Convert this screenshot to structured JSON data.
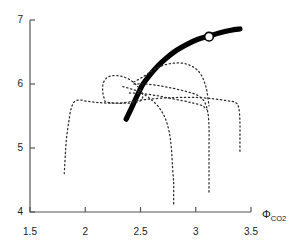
{
  "chart_data": {
    "type": "line",
    "title": "",
    "xlabel": "Φ_CO2",
    "xlabel_base": "Φ",
    "xlabel_sub": "CO",
    "xlabel_sub2": "2",
    "ylabel": "",
    "xlim": [
      1.5,
      3.5
    ],
    "ylim": [
      4,
      7
    ],
    "grid": false,
    "legend": null,
    "xticks": [
      1.5,
      2,
      2.5,
      3,
      3.5
    ],
    "xtick_labels": [
      "1.5",
      "2",
      "2.5",
      "3",
      "3.5"
    ],
    "yticks": [
      4,
      5,
      6,
      7
    ],
    "ytick_labels": [
      "4",
      "5",
      "6",
      "7"
    ],
    "series": [
      {
        "name": "main-bold-curve",
        "style": "solid-thick",
        "color": "#000000",
        "points": [
          [
            2.37,
            5.45
          ],
          [
            2.42,
            5.63
          ],
          [
            2.47,
            5.82
          ],
          [
            2.52,
            5.99
          ],
          [
            2.58,
            6.13
          ],
          [
            2.65,
            6.27
          ],
          [
            2.73,
            6.4
          ],
          [
            2.82,
            6.52
          ],
          [
            2.92,
            6.62
          ],
          [
            3.02,
            6.7
          ],
          [
            3.12,
            6.75
          ],
          [
            3.22,
            6.8
          ],
          [
            3.32,
            6.84
          ],
          [
            3.4,
            6.86
          ]
        ]
      },
      {
        "name": "dotted-curve-left",
        "style": "dotted",
        "color": "#2b2b2b",
        "points": [
          [
            1.81,
            4.6
          ],
          [
            1.82,
            4.9
          ],
          [
            1.83,
            5.15
          ],
          [
            1.85,
            5.4
          ],
          [
            1.87,
            5.6
          ],
          [
            1.9,
            5.72
          ],
          [
            1.95,
            5.75
          ],
          [
            2.02,
            5.73
          ],
          [
            2.12,
            5.71
          ],
          [
            2.24,
            5.7
          ],
          [
            2.36,
            5.71
          ],
          [
            2.46,
            5.74
          ],
          [
            2.56,
            5.76
          ],
          [
            2.7,
            5.78
          ],
          [
            2.85,
            5.79
          ],
          [
            3.0,
            5.79
          ],
          [
            3.15,
            5.77
          ],
          [
            3.28,
            5.74
          ],
          [
            3.36,
            5.71
          ],
          [
            3.39,
            5.62
          ],
          [
            3.4,
            5.4
          ],
          [
            3.4,
            5.15
          ],
          [
            3.4,
            4.93
          ]
        ]
      },
      {
        "name": "dotted-curve-loop",
        "style": "dotted",
        "color": "#2b2b2b",
        "points": [
          [
            2.18,
            5.72
          ],
          [
            2.16,
            5.86
          ],
          [
            2.16,
            5.99
          ],
          [
            2.19,
            6.09
          ],
          [
            2.25,
            6.13
          ],
          [
            2.33,
            6.12
          ],
          [
            2.41,
            6.06
          ],
          [
            2.47,
            5.97
          ],
          [
            2.51,
            5.88
          ],
          [
            2.52,
            5.8
          ],
          [
            2.5,
            5.74
          ],
          [
            2.44,
            5.71
          ],
          [
            2.36,
            5.7
          ],
          [
            2.28,
            5.7
          ],
          [
            2.22,
            5.71
          ],
          [
            2.18,
            5.72
          ]
        ]
      },
      {
        "name": "dotted-curve-mid-descend",
        "style": "dotted",
        "color": "#2b2b2b",
        "points": [
          [
            2.34,
            5.96
          ],
          [
            2.42,
            5.92
          ],
          [
            2.5,
            5.87
          ],
          [
            2.58,
            5.78
          ],
          [
            2.66,
            5.65
          ],
          [
            2.72,
            5.48
          ],
          [
            2.76,
            5.25
          ],
          [
            2.78,
            4.98
          ],
          [
            2.79,
            4.7
          ],
          [
            2.8,
            4.45
          ],
          [
            2.8,
            4.24
          ],
          [
            2.8,
            4.1
          ]
        ]
      },
      {
        "name": "dotted-curve-right-arc",
        "style": "dotted",
        "color": "#2b2b2b",
        "points": [
          [
            2.44,
            6.0
          ],
          [
            2.55,
            6.0
          ],
          [
            2.68,
            5.97
          ],
          [
            2.8,
            5.93
          ],
          [
            2.92,
            5.88
          ],
          [
            3.02,
            5.82
          ],
          [
            3.08,
            5.72
          ],
          [
            3.11,
            5.55
          ],
          [
            3.12,
            5.32
          ],
          [
            3.12,
            5.08
          ],
          [
            3.12,
            4.85
          ],
          [
            3.12,
            4.62
          ],
          [
            3.12,
            4.42
          ],
          [
            3.12,
            4.28
          ]
        ]
      },
      {
        "name": "dotted-curve-upper-right",
        "style": "dotted",
        "color": "#2b2b2b",
        "points": [
          [
            2.44,
            6.03
          ],
          [
            2.53,
            6.12
          ],
          [
            2.62,
            6.22
          ],
          [
            2.72,
            6.3
          ],
          [
            2.83,
            6.33
          ],
          [
            2.92,
            6.31
          ],
          [
            3.0,
            6.24
          ],
          [
            3.05,
            6.14
          ],
          [
            3.08,
            6.02
          ],
          [
            3.1,
            5.9
          ],
          [
            3.11,
            5.78
          ],
          [
            3.12,
            5.66
          ]
        ]
      },
      {
        "name": "dotted-curve-inner-diagonal",
        "style": "dotted",
        "color": "#2b2b2b",
        "points": [
          [
            2.4,
            5.86
          ],
          [
            2.52,
            5.85
          ],
          [
            2.64,
            5.82
          ],
          [
            2.76,
            5.78
          ],
          [
            2.88,
            5.74
          ],
          [
            2.98,
            5.7
          ],
          [
            3.06,
            5.66
          ],
          [
            3.1,
            5.6
          ]
        ]
      }
    ],
    "markers": [
      {
        "name": "highlight-point",
        "x": 3.12,
        "y": 6.74,
        "shape": "circle-open",
        "fill": "#ffffff",
        "stroke": "#000000"
      }
    ]
  }
}
